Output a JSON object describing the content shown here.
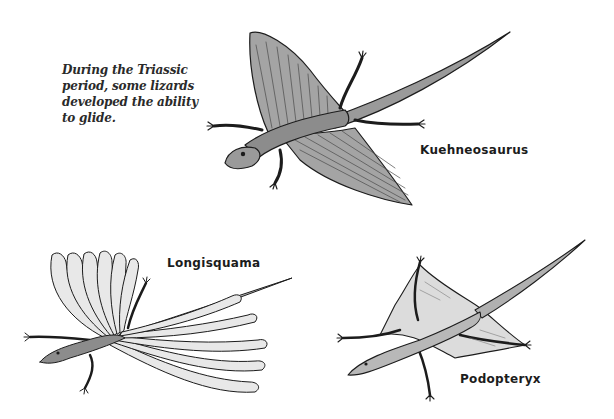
{
  "caption": {
    "lines": [
      "During the Triassic",
      "period, some lizards",
      "developed the ability",
      "to glide."
    ]
  },
  "illustrations": [
    {
      "name": "Kuehneosaurus",
      "label": "Kuehneosaurus"
    },
    {
      "name": "Longisquama",
      "label": "Longisquama"
    },
    {
      "name": "Podopteryx",
      "label": "Podopteryx"
    }
  ],
  "colors": {
    "background": "#ffffff",
    "ink": "#1c1c1c",
    "wing_shade": "#a8a8a8",
    "body_shade": "#8c8c8c",
    "membrane_light": "#dcdcdc"
  }
}
